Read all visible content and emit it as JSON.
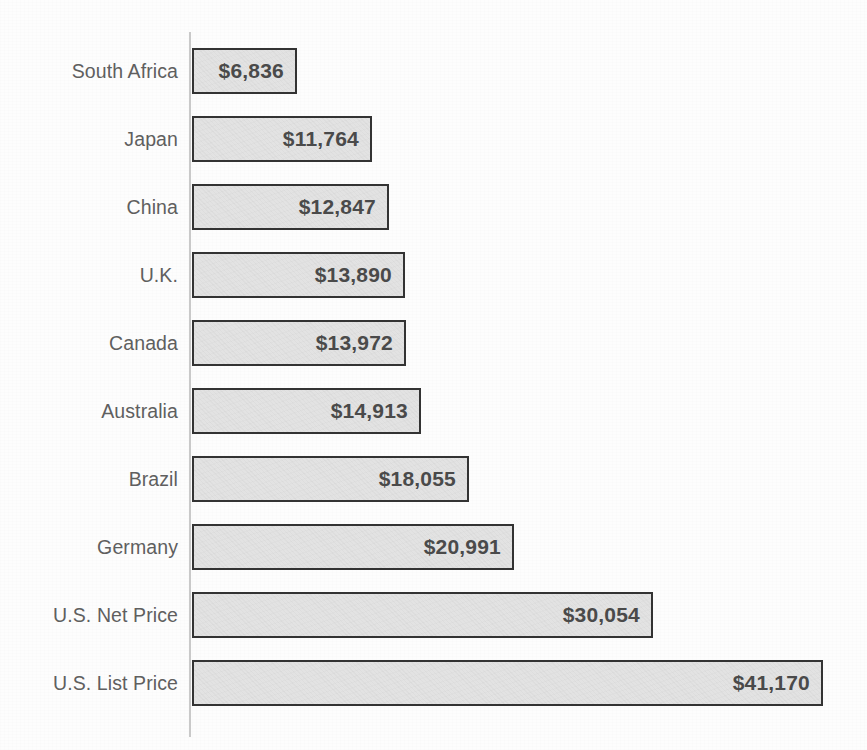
{
  "chart": {
    "type": "bar",
    "orientation": "horizontal",
    "title": "",
    "subtitle": "",
    "xlabel": "",
    "ylabel": "",
    "currency_symbol": "$",
    "grid": false,
    "legend": null,
    "axis_line_color": "#c9c9c9",
    "bar_fill_color": "#e2e2e2",
    "bar_border_color": "#333333",
    "label_color": "#5f5f5f",
    "value_color": "#4a4a4a",
    "background_color": "#fdfdfd"
  },
  "chart_data": {
    "type": "bar",
    "title": "",
    "xlabel": "",
    "ylabel": "",
    "xlim": [
      0,
      41170
    ],
    "grid": false,
    "legend": null,
    "categories": [
      "South Africa",
      "Japan",
      "China",
      "U.K.",
      "Canada",
      "Australia",
      "Brazil",
      "Germany",
      "U.S. Net Price",
      "U.S. List Price"
    ],
    "values": [
      6836,
      11764,
      12847,
      13890,
      13972,
      14913,
      18055,
      20991,
      30054,
      41170
    ],
    "value_labels": [
      "$6,836",
      "$11,764",
      "$12,847",
      "$13,890",
      "$13,972",
      "$14,913",
      "$18,055",
      "$20,991",
      "$30,054",
      "$41,170"
    ]
  },
  "bars": [
    {
      "label": "South Africa",
      "value": 6836,
      "value_label": "$6,836"
    },
    {
      "label": "Japan",
      "value": 11764,
      "value_label": "$11,764"
    },
    {
      "label": "China",
      "value": 12847,
      "value_label": "$12,847"
    },
    {
      "label": "U.K.",
      "value": 13890,
      "value_label": "$13,890"
    },
    {
      "label": "Canada",
      "value": 13972,
      "value_label": "$13,972"
    },
    {
      "label": "Australia",
      "value": 14913,
      "value_label": "$14,913"
    },
    {
      "label": "Brazil",
      "value": 18055,
      "value_label": "$18,055"
    },
    {
      "label": "Germany",
      "value": 20991,
      "value_label": "$20,991"
    },
    {
      "label": "U.S. Net Price",
      "value": 30054,
      "value_label": "$30,054"
    },
    {
      "label": "U.S. List Price",
      "value": 41170,
      "value_label": "$41,170"
    }
  ]
}
